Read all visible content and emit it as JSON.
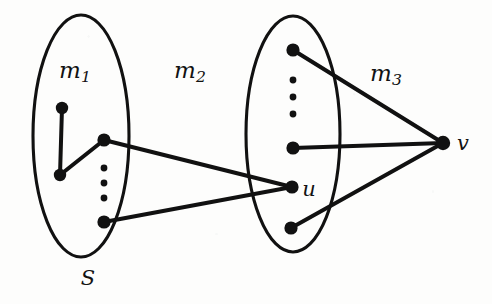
{
  "figure": {
    "type": "graph-diagram",
    "width": 492,
    "height": 304,
    "background_color": "#fdfdfc",
    "ink_color": "#111111"
  },
  "labels": {
    "m1": {
      "base": "m",
      "sub": "1",
      "x": 75,
      "y": 72
    },
    "m2": {
      "base": "m",
      "sub": "2",
      "x": 190,
      "y": 72
    },
    "m3": {
      "base": "m",
      "sub": "3",
      "x": 386,
      "y": 75
    },
    "u": {
      "base": "u",
      "sub": "",
      "x": 309,
      "y": 189
    },
    "v": {
      "base": "v",
      "sub": "",
      "x": 463,
      "y": 143
    },
    "S": {
      "base": "S",
      "sub": "",
      "x": 88,
      "y": 278
    }
  },
  "groups": [
    {
      "name": "left-set",
      "label": "S",
      "cx": 81,
      "cy": 136,
      "rx": 48,
      "ry": 121
    },
    {
      "name": "right-set",
      "label": "",
      "cx": 293,
      "cy": 134,
      "rx": 47,
      "ry": 118
    }
  ],
  "vertices": [
    {
      "id": "s-top",
      "x": 62,
      "y": 108,
      "r": 6.2,
      "label": ""
    },
    {
      "id": "s-mid",
      "x": 60,
      "y": 175,
      "r": 6.2,
      "label": ""
    },
    {
      "id": "s-hub",
      "x": 104,
      "y": 140,
      "r": 6.6,
      "label": ""
    },
    {
      "id": "s-bottom",
      "x": 104,
      "y": 222,
      "r": 6.6,
      "label": ""
    },
    {
      "id": "t-top",
      "x": 293,
      "y": 50,
      "r": 6.6,
      "label": ""
    },
    {
      "id": "t-mid",
      "x": 293,
      "y": 148,
      "r": 6.6,
      "label": ""
    },
    {
      "id": "u",
      "x": 292,
      "y": 187,
      "r": 6.6,
      "label": "u"
    },
    {
      "id": "t-bottom",
      "x": 291,
      "y": 228,
      "r": 6.6,
      "label": ""
    },
    {
      "id": "v",
      "x": 443,
      "y": 143,
      "r": 7.2,
      "label": "v"
    }
  ],
  "edges": [
    {
      "from": "s-top",
      "to": "s-mid"
    },
    {
      "from": "s-mid",
      "to": "s-hub"
    },
    {
      "from": "s-hub",
      "to": "u"
    },
    {
      "from": "s-bottom",
      "to": "u"
    },
    {
      "from": "t-top",
      "to": "v"
    },
    {
      "from": "t-mid",
      "to": "v"
    },
    {
      "from": "t-bottom",
      "to": "v"
    }
  ],
  "ellipsis_dots": [
    {
      "group": "left-set",
      "x": 104,
      "y": 168,
      "r": 3.4
    },
    {
      "group": "left-set",
      "x": 104,
      "y": 183,
      "r": 3.4
    },
    {
      "group": "left-set",
      "x": 104,
      "y": 198,
      "r": 3.4
    },
    {
      "group": "right-set",
      "x": 293,
      "y": 80,
      "r": 3.4
    },
    {
      "group": "right-set",
      "x": 293,
      "y": 97,
      "r": 3.4
    },
    {
      "group": "right-set",
      "x": 293,
      "y": 114,
      "r": 3.4
    }
  ]
}
